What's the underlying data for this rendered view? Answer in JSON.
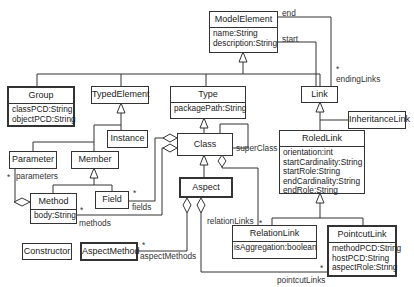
{
  "diagram": {
    "type": "uml-class-diagram",
    "classes": {
      "model_element": {
        "name": "ModelElement",
        "attributes": [
          "name:String",
          "description:String"
        ]
      },
      "group": {
        "name": "Group",
        "attributes": [
          "classPCD:String",
          "objectPCD:String"
        ]
      },
      "typed_element": {
        "name": "TypedElement",
        "attributes": []
      },
      "type": {
        "name": "Type",
        "attributes": [
          "packagePath:String"
        ]
      },
      "link": {
        "name": "Link",
        "attributes": []
      },
      "inheritance_link": {
        "name": "InheritanceLink",
        "attributes": []
      },
      "instance": {
        "name": "Instance",
        "attributes": []
      },
      "class": {
        "name": "Class",
        "attributes": []
      },
      "roled_link": {
        "name": "RoledLink",
        "attributes": [
          "orientation:int",
          "startCardinality:String",
          "startRole:String",
          "endCardinality:String",
          "endRole:String"
        ]
      },
      "parameter": {
        "name": "Parameter",
        "attributes": []
      },
      "member": {
        "name": "Member",
        "attributes": []
      },
      "aspect": {
        "name": "Aspect",
        "attributes": []
      },
      "method": {
        "name": "Method",
        "attributes": [
          "body:String"
        ]
      },
      "field": {
        "name": "Field",
        "attributes": []
      },
      "relation_link": {
        "name": "RelationLink",
        "attributes": [
          "isAggregation:boolean"
        ]
      },
      "pointcut_link": {
        "name": "PointcutLink",
        "attributes": [
          "methodPCD:String",
          "hostPCD:String",
          "aspectRole:String"
        ]
      },
      "constructor": {
        "name": "Constructor",
        "attributes": []
      },
      "aspect_method": {
        "name": "AspectMethod",
        "attributes": []
      }
    },
    "labels": {
      "end": "end",
      "start": "start",
      "ending_links_mult": "*",
      "ending_links": "endingLinks",
      "super_class": "superClass",
      "parameters_mult": "*",
      "parameters": "parameters",
      "fields_mult": "*",
      "fields": "fields",
      "methods_mult": "*",
      "methods": "methods",
      "relation_links": "relationLinks",
      "relation_links_mult": "*",
      "aspect_methods_mult": "*",
      "aspect_methods": "aspectMethods",
      "pointcut_links_mult": "*",
      "pointcut_links": "pointcutLinks"
    },
    "relationships": [
      {
        "kind": "generalization",
        "from": "Group",
        "to": "ModelElement"
      },
      {
        "kind": "generalization",
        "from": "TypedElement",
        "to": "ModelElement"
      },
      {
        "kind": "generalization",
        "from": "Type",
        "to": "ModelElement"
      },
      {
        "kind": "generalization",
        "from": "Link",
        "to": "ModelElement"
      },
      {
        "kind": "association",
        "from": "Link",
        "to": "ModelElement",
        "role": "start"
      },
      {
        "kind": "association",
        "from": "Link",
        "to": "ModelElement",
        "role": "end",
        "opposite": "endingLinks",
        "multiplicity": "*"
      },
      {
        "kind": "generalization",
        "from": "Instance",
        "to": "TypedElement"
      },
      {
        "kind": "generalization",
        "from": "Parameter",
        "to": "TypedElement"
      },
      {
        "kind": "generalization",
        "from": "Member",
        "to": "TypedElement"
      },
      {
        "kind": "generalization",
        "from": "Method",
        "to": "Member"
      },
      {
        "kind": "generalization",
        "from": "Field",
        "to": "Member"
      },
      {
        "kind": "generalization",
        "from": "Class",
        "to": "Type"
      },
      {
        "kind": "association",
        "from": "Class",
        "to": "Class",
        "role": "superClass"
      },
      {
        "kind": "generalization",
        "from": "Aspect",
        "to": "Class"
      },
      {
        "kind": "aggregation",
        "whole": "Method",
        "part": "Parameter",
        "role": "parameters",
        "multiplicity": "*"
      },
      {
        "kind": "aggregation",
        "whole": "Class",
        "part": "Field",
        "role": "fields",
        "multiplicity": "*"
      },
      {
        "kind": "aggregation",
        "whole": "Class",
        "part": "Method",
        "role": "methods",
        "multiplicity": "*"
      },
      {
        "kind": "aggregation",
        "whole": "Class",
        "part": "RelationLink",
        "role": "relationLinks",
        "multiplicity": "*"
      },
      {
        "kind": "aggregation",
        "whole": "Aspect",
        "part": "AspectMethod",
        "role": "aspectMethods",
        "multiplicity": "*"
      },
      {
        "kind": "aggregation",
        "whole": "Aspect",
        "part": "PointcutLink",
        "role": "pointcutLinks",
        "multiplicity": "*"
      },
      {
        "kind": "generalization",
        "from": "InheritanceLink",
        "to": "Link"
      },
      {
        "kind": "generalization",
        "from": "RoledLink",
        "to": "Link"
      },
      {
        "kind": "generalization",
        "from": "RelationLink",
        "to": "RoledLink"
      },
      {
        "kind": "generalization",
        "from": "PointcutLink",
        "to": "RoledLink"
      }
    ]
  }
}
